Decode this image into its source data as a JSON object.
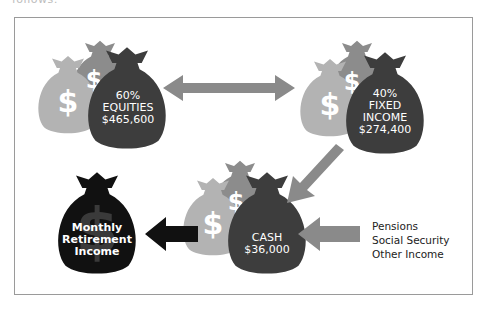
{
  "header": {
    "cut_text": "follows:"
  },
  "colors": {
    "light_bag": "#b3b3b3",
    "mid_bag": "#8c8c8c",
    "dark_bag": "#3d3d3d",
    "black_bag": "#111111",
    "arrow_gray": "#8a8a8a",
    "arrow_black": "#111111",
    "dollar_watermark": "#3a3a3a"
  },
  "nodes": {
    "equities": {
      "pct": "60%",
      "name": "EQUITIES",
      "amount": "$465,600"
    },
    "fixed_income": {
      "pct": "40%",
      "name1": "FIXED",
      "name2": "INCOME",
      "amount": "$274,400"
    },
    "cash": {
      "name": "CASH",
      "amount": "$36,000"
    },
    "monthly": {
      "line1": "Monthly",
      "line2": "Retirement",
      "line3": "Income"
    }
  },
  "sources": {
    "items": [
      "Pensions",
      "Social Security",
      "Other Income"
    ]
  },
  "icons": {
    "dollar": "$"
  }
}
